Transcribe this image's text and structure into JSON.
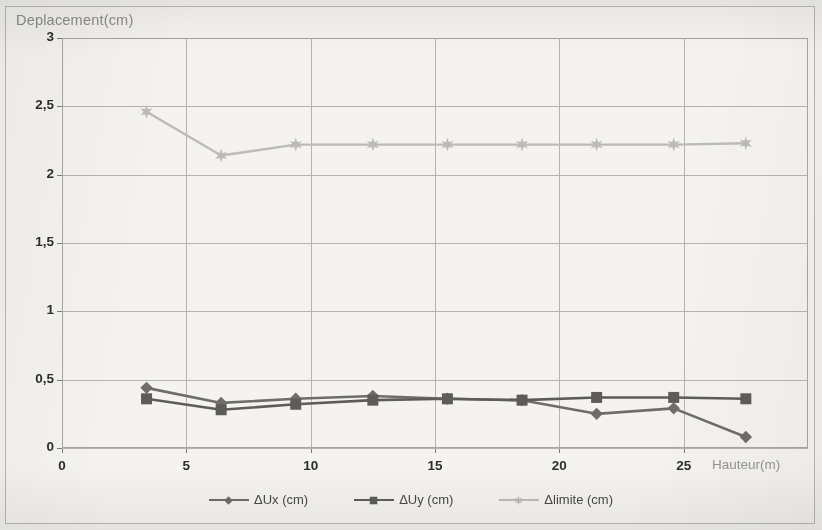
{
  "figure": {
    "background_color": "#f2f1ee",
    "frame_color": "#b9b7b2"
  },
  "axis": {
    "y_title": "Deplacement(cm)",
    "x_title": "Hauteur(m)",
    "y_tick_labels": [
      "0",
      "0,5",
      "1",
      "1,5",
      "2",
      "2,5",
      "3"
    ],
    "x_tick_labels": [
      "0",
      "5",
      "10",
      "15",
      "20",
      "25"
    ],
    "label_color": "#2e2d2b",
    "title_color": "#8d8b87"
  },
  "legend": {
    "items": [
      {
        "label": "ΔUx (cm)",
        "marker": "diamond-marker-icon",
        "color": "#6f6d69"
      },
      {
        "label": "ΔUy (cm)",
        "marker": "square-marker-icon",
        "color": "#5e5c58"
      },
      {
        "label": "Δlimite (cm)",
        "marker": "star-marker-icon",
        "color": "#bdbbb6"
      }
    ]
  },
  "chart_data": {
    "type": "line",
    "title": "",
    "xlabel": "Hauteur(m)",
    "ylabel": "Deplacement(cm)",
    "xlim": [
      0,
      30
    ],
    "ylim": [
      0,
      3
    ],
    "xticks": [
      0,
      5,
      10,
      15,
      20,
      25
    ],
    "yticks": [
      0,
      0.5,
      1,
      1.5,
      2,
      2.5,
      3
    ],
    "grid": true,
    "legend_position": "bottom",
    "x": [
      3.4,
      6.4,
      9.4,
      12.5,
      15.5,
      18.5,
      21.5,
      24.6,
      27.5
    ],
    "series": [
      {
        "name": "ΔUx (cm)",
        "marker": "diamond",
        "color": "#6f6d69",
        "values": [
          0.44,
          0.33,
          0.36,
          0.38,
          0.36,
          0.35,
          0.25,
          0.29,
          0.08
        ]
      },
      {
        "name": "ΔUy (cm)",
        "marker": "square",
        "color": "#5e5c58",
        "values": [
          0.36,
          0.28,
          0.32,
          0.35,
          0.36,
          0.35,
          0.37,
          0.37,
          0.36
        ]
      },
      {
        "name": "Δlimite (cm)",
        "marker": "star",
        "color": "#bdbbb6",
        "values": [
          2.46,
          2.14,
          2.22,
          2.22,
          2.22,
          2.22,
          2.22,
          2.22,
          2.23
        ]
      }
    ]
  }
}
